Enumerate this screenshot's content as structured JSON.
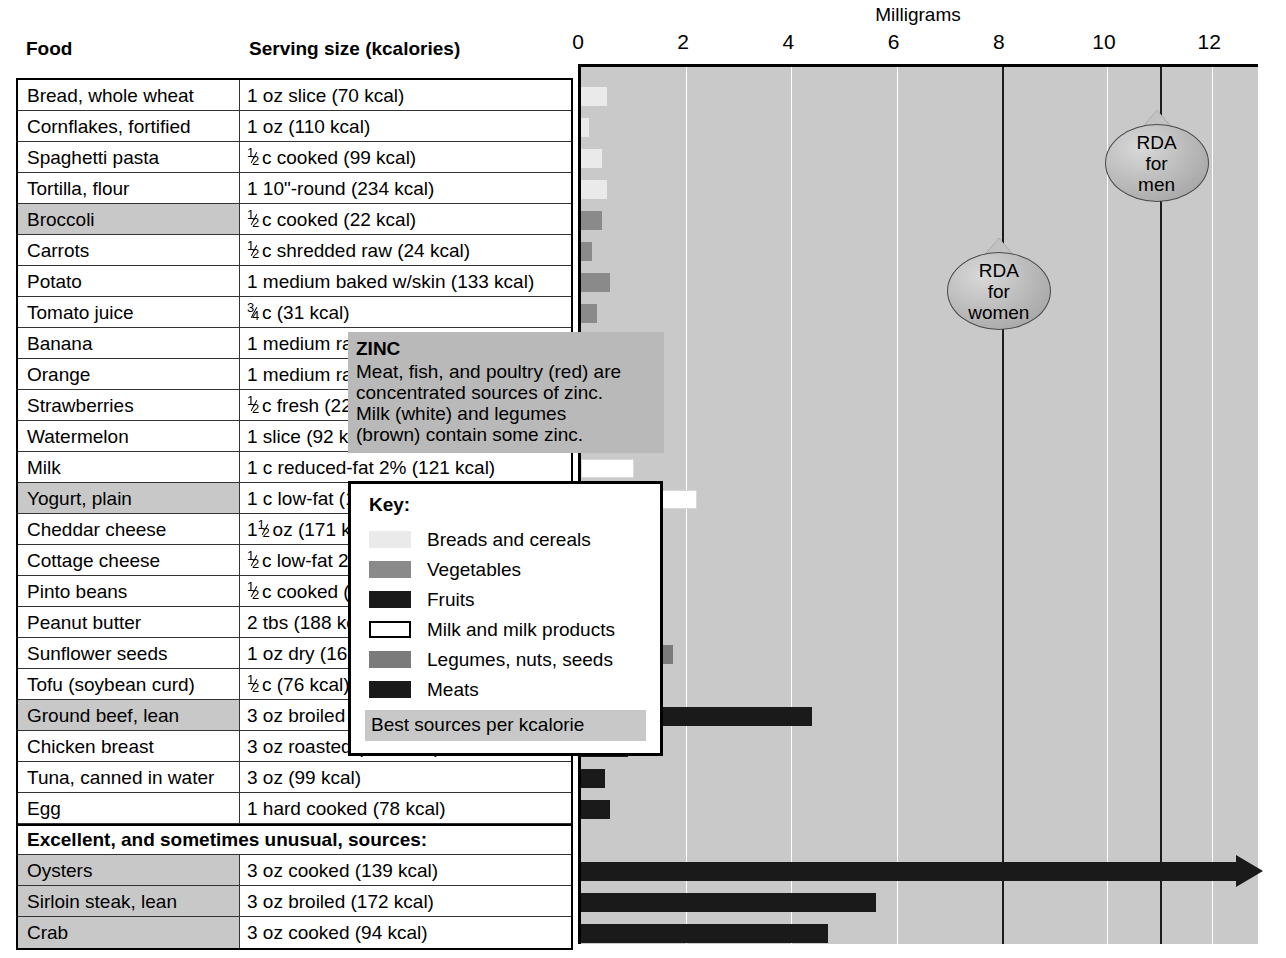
{
  "chart_data": {
    "type": "bar",
    "title": "Milligrams",
    "xlabel": "Milligrams",
    "ylabel": "",
    "xlim": [
      0,
      12.8
    ],
    "grid": true,
    "orientation": "horizontal",
    "tick_values": [
      0,
      2,
      4,
      6,
      8,
      10,
      12
    ],
    "tick_labels": [
      "0",
      "2",
      "4",
      "6",
      "8",
      "10",
      "12"
    ],
    "reference_lines": [
      {
        "label": "RDA for women",
        "value": 8,
        "lines": [
          "RDA",
          "for",
          "women"
        ]
      },
      {
        "label": "RDA for men",
        "value": 11,
        "lines": [
          "RDA",
          "for",
          "men"
        ]
      }
    ],
    "categories": [
      "Bread, whole wheat",
      "Cornflakes, fortified",
      "Spaghetti pasta",
      "Tortilla, flour",
      "Broccoli",
      "Carrots",
      "Potato",
      "Tomato juice",
      "Banana",
      "Orange",
      "Strawberries",
      "Watermelon",
      "Milk",
      "Yogurt, plain",
      "Cheddar cheese",
      "Cottage cheese",
      "Pinto beans",
      "Peanut butter",
      "Sunflower seeds",
      "Tofu (soybean curd)",
      "Ground beef, lean",
      "Chicken breast",
      "Tuna, canned in water",
      "Egg",
      "Oysters",
      "Sirloin steak, lean",
      "Crab"
    ],
    "values": [
      0.5,
      0.15,
      0.4,
      0.5,
      0.4,
      0.2,
      0.55,
      0.3,
      0.2,
      0.1,
      0.15,
      0.25,
      1.0,
      2.2,
      1.4,
      0.6,
      0.9,
      0.9,
      1.75,
      0.8,
      4.4,
      0.9,
      0.45,
      0.55,
      13.5,
      5.6,
      4.7
    ],
    "group_colors": {
      "breads_and_cereals": "#eaeaea",
      "vegetables": "#8a8a8a",
      "fruits": "#1a1a1a",
      "milk_and_milk_products": "#ffffff",
      "legumes_nuts_seeds": "#7b7b7b",
      "meats": "#1a1a1a"
    },
    "plot_background": "#c9c9c9",
    "gridline_color": "#ffffff"
  },
  "axis": {
    "title": "Milligrams",
    "ticks": [
      {
        "label": "0",
        "value": 0
      },
      {
        "label": "2",
        "value": 2
      },
      {
        "label": "4",
        "value": 4
      },
      {
        "label": "6",
        "value": 6
      },
      {
        "label": "8",
        "value": 8
      },
      {
        "label": "10",
        "value": 10
      },
      {
        "label": "12",
        "value": 12
      }
    ]
  },
  "headers": {
    "food": "Food",
    "serving": "Serving size (kcalories)"
  },
  "section_label": "Excellent, and sometimes unusual, sources:",
  "rows": [
    {
      "food": "Bread, whole wheat",
      "serving": "1 oz slice (70 kcal)",
      "serving_frac": null,
      "serving_rest": "1 oz slice (70 kcal)",
      "group": "breads",
      "value": 0.5,
      "best": false
    },
    {
      "food": "Cornflakes, fortified",
      "serving": "1 oz (110 kcal)",
      "serving_frac": null,
      "serving_rest": "1 oz (110 kcal)",
      "group": "breads",
      "value": 0.15,
      "best": false
    },
    {
      "food": "Spaghetti pasta",
      "serving": "½ c cooked (99 kcal)",
      "serving_frac": "1/2",
      "serving_rest": "c cooked (99 kcal)",
      "group": "breads",
      "value": 0.4,
      "best": false
    },
    {
      "food": "Tortilla, flour",
      "serving": "1 10\"-round (234 kcal)",
      "serving_frac": null,
      "serving_rest": "1 10\"-round (234 kcal)",
      "group": "breads",
      "value": 0.5,
      "best": false
    },
    {
      "food": "Broccoli",
      "serving": "½ c cooked (22 kcal)",
      "serving_frac": "1/2",
      "serving_rest": "c cooked (22 kcal)",
      "group": "vegetables",
      "value": 0.4,
      "best": true
    },
    {
      "food": "Carrots",
      "serving": "½ c shredded raw (24 kcal)",
      "serving_frac": "1/2",
      "serving_rest": "c shredded raw (24 kcal)",
      "group": "vegetables",
      "value": 0.2,
      "best": false
    },
    {
      "food": "Potato",
      "serving": "1 medium baked w/skin (133 kcal)",
      "serving_frac": null,
      "serving_rest": "1 medium baked w/skin (133 kcal)",
      "group": "vegetables",
      "value": 0.55,
      "best": false
    },
    {
      "food": "Tomato juice",
      "serving": "¾ c (31 kcal)",
      "serving_frac": "3/4",
      "serving_rest": "c (31 kcal)",
      "group": "vegetables",
      "value": 0.3,
      "best": false
    },
    {
      "food": "Banana",
      "serving": "1 medium raw (109 kcal)",
      "serving_frac": null,
      "serving_rest": "1 medium raw (109 kcal)",
      "group": "fruits",
      "value": 0.2,
      "best": false
    },
    {
      "food": "Orange",
      "serving": "1 medium raw (62 kcal)",
      "serving_frac": null,
      "serving_rest": "1 medium raw (62 kcal)",
      "group": "fruits",
      "value": 0.1,
      "best": false
    },
    {
      "food": "Strawberries",
      "serving": "½ c fresh (22 kcal)",
      "serving_frac": "1/2",
      "serving_rest": "c fresh (22 kcal)",
      "group": "fruits",
      "value": 0.15,
      "best": false
    },
    {
      "food": "Watermelon",
      "serving": "1 slice (92 kcal)",
      "serving_frac": null,
      "serving_rest": "1 slice (92 kcal)",
      "group": "fruits",
      "value": 0.25,
      "best": false
    },
    {
      "food": "Milk",
      "serving": "1 c reduced-fat 2% (121 kcal)",
      "serving_frac": null,
      "serving_rest": "1 c reduced-fat 2% (121 kcal)",
      "group": "milk",
      "value": 1.0,
      "best": false
    },
    {
      "food": "Yogurt, plain",
      "serving": "1 c low-fat (155 kcal)",
      "serving_frac": null,
      "serving_rest": "1 c low-fat (155 kcal)",
      "group": "milk",
      "value": 2.2,
      "best": true
    },
    {
      "food": "Cheddar cheese",
      "serving": "1½ oz (171 kcal)",
      "serving_frac": "1 1/2",
      "serving_rest": "oz (171 kcal)",
      "group": "milk",
      "value": 1.4,
      "best": false
    },
    {
      "food": "Cottage cheese",
      "serving": "½ c low-fat 2% (101 kcal)",
      "serving_frac": "1/2",
      "serving_rest": "c low-fat 2% (101 kcal)",
      "group": "milk",
      "value": 0.6,
      "best": false
    },
    {
      "food": "Pinto beans",
      "serving": "½ c cooked (117 kcal)",
      "serving_frac": "1/2",
      "serving_rest": "c cooked (117 kcal)",
      "group": "legumes",
      "value": 0.9,
      "best": false
    },
    {
      "food": "Peanut butter",
      "serving": "2 tbs (188 kcal)",
      "serving_frac": null,
      "serving_rest": "2 tbs (188 kcal)",
      "group": "legumes",
      "value": 0.9,
      "best": false
    },
    {
      "food": "Sunflower seeds",
      "serving": "1 oz dry (165 kcal)",
      "serving_frac": null,
      "serving_rest": "1 oz dry (165 kcal)",
      "group": "legumes",
      "value": 1.75,
      "best": false
    },
    {
      "food": "Tofu (soybean curd)",
      "serving": "½ c (76 kcal)",
      "serving_frac": "1/2",
      "serving_rest": "c (76 kcal)",
      "group": "legumes",
      "value": 0.8,
      "best": false
    },
    {
      "food": "Ground beef, lean",
      "serving": "3 oz broiled (244 kcal)",
      "serving_frac": null,
      "serving_rest": "3 oz broiled (244 kcal)",
      "group": "meats",
      "value": 4.4,
      "best": true
    },
    {
      "food": "Chicken breast",
      "serving": "3 oz roasted (140 kcal)",
      "serving_frac": null,
      "serving_rest": "3 oz roasted (140 kcal)",
      "group": "meats",
      "value": 0.9,
      "best": false
    },
    {
      "food": "Tuna, canned in water",
      "serving": "3 oz (99 kcal)",
      "serving_frac": null,
      "serving_rest": "3 oz (99 kcal)",
      "group": "meats",
      "value": 0.45,
      "best": false
    },
    {
      "food": "Egg",
      "serving": "1 hard cooked (78 kcal)",
      "serving_frac": null,
      "serving_rest": "1 hard cooked (78 kcal)",
      "group": "meats",
      "value": 0.55,
      "best": false
    },
    {
      "food": "Oysters",
      "serving": "3 oz cooked (139 kcal)",
      "serving_frac": null,
      "serving_rest": "3 oz cooked (139 kcal)",
      "group": "meats",
      "value": 13.5,
      "best": true,
      "overflow": true
    },
    {
      "food": "Sirloin steak, lean",
      "serving": "3 oz broiled (172 kcal)",
      "serving_frac": null,
      "serving_rest": "3 oz broiled (172 kcal)",
      "group": "meats",
      "value": 5.6,
      "best": true
    },
    {
      "food": "Crab",
      "serving": "3 oz cooked (94 kcal)",
      "serving_frac": null,
      "serving_rest": "3 oz cooked (94 kcal)",
      "group": "meats",
      "value": 4.7,
      "best": true
    }
  ],
  "info_box": {
    "title": "ZINC",
    "lines": [
      "Meat, fish, and poultry (red) are",
      "concentrated sources of zinc.",
      "Milk (white) and legumes",
      "(brown) contain some zinc."
    ]
  },
  "key": {
    "title": "Key:",
    "items": [
      {
        "label": "Breads and cereals",
        "color": "#eaeaea",
        "bordered": false
      },
      {
        "label": "Vegetables",
        "color": "#8a8a8a",
        "bordered": false
      },
      {
        "label": "Fruits",
        "color": "#1a1a1a",
        "bordered": false
      },
      {
        "label": "Milk and milk products",
        "color": "#ffffff",
        "bordered": true
      },
      {
        "label": "Legumes, nuts, seeds",
        "color": "#7b7b7b",
        "bordered": false
      },
      {
        "label": "Meats",
        "color": "#1a1a1a",
        "bordered": false
      }
    ],
    "best_label": "Best sources per kcalorie"
  }
}
